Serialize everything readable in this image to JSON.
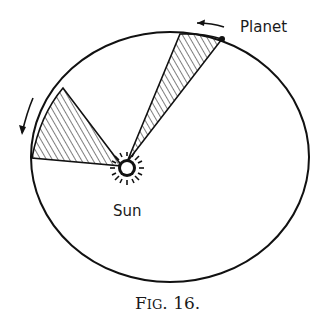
{
  "figure": {
    "caption": "Fig. 16.",
    "caption_display": "FIG. 16."
  },
  "labels": {
    "planet": "Planet",
    "sun": "Sun"
  },
  "diagram": {
    "type": "Kepler's second law - equal areas in equal times",
    "ellipse": {
      "cx": 170,
      "cy": 157,
      "rx": 139,
      "ry": 125
    },
    "sun": {
      "x": 127,
      "y": 168,
      "r": 6
    },
    "sectors": [
      {
        "name": "near-aphelion",
        "points": [
          [
            127,
            168
          ],
          [
            180,
            34
          ],
          [
            222,
            39
          ]
        ]
      },
      {
        "name": "near-perihelion",
        "points": [
          [
            127,
            168
          ],
          [
            63,
            88
          ],
          [
            32,
            158
          ]
        ]
      }
    ],
    "arrows": [
      {
        "name": "planet-motion-arrow",
        "direction": "left"
      },
      {
        "name": "orbit-direction-arrow",
        "direction": "down"
      }
    ],
    "colors": {
      "stroke": "#111111",
      "background": "#ffffff"
    }
  }
}
